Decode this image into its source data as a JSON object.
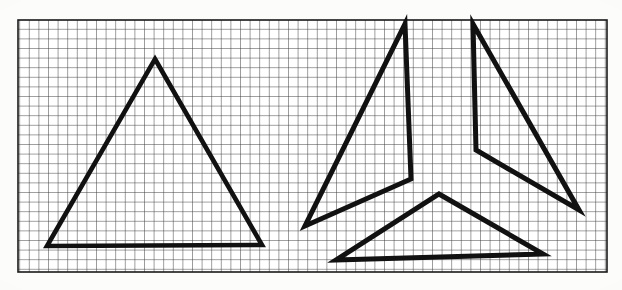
{
  "figure": {
    "kind": "line-drawing",
    "background_color": "#fcfcfb",
    "ink_color": "#111111",
    "grid_color": "#3b3b3b"
  },
  "canvas": {
    "width": 622,
    "height": 290
  },
  "grid": {
    "label": "graph-paper grid",
    "x": 18,
    "y": 20,
    "width": 589,
    "height": 252,
    "cell_size": 9.6,
    "line_color": "#3d3d3d",
    "line_width": 1.0,
    "border_color": "#1a1a1a",
    "border_width": 1.6,
    "columns": 61,
    "rows": 26
  },
  "shapes": [
    {
      "name": "intact-triangle",
      "role": "complete triangle on the left",
      "stroke_width": 4.6,
      "closed": true,
      "points": [
        [
          155,
          59
        ],
        [
          262,
          245
        ],
        [
          47,
          246
        ]
      ]
    },
    {
      "name": "fragment-left-chevron",
      "role": "left arm of the fragmented triangle",
      "stroke_width": 5.0,
      "closed": true,
      "points": [
        [
          405,
          24
        ],
        [
          411,
          179
        ],
        [
          305,
          226
        ]
      ]
    },
    {
      "name": "fragment-right-chevron",
      "role": "right arm of the fragmented triangle",
      "stroke_width": 5.0,
      "closed": true,
      "points": [
        [
          473,
          24
        ],
        [
          579,
          210
        ],
        [
          476,
          150
        ]
      ]
    },
    {
      "name": "fragment-bottom-chevron",
      "role": "base arm of the fragmented triangle",
      "stroke_width": 5.0,
      "closed": true,
      "points": [
        [
          439,
          194
        ],
        [
          543,
          254
        ],
        [
          336,
          260
        ]
      ]
    }
  ],
  "chart_data": {
    "type": "scatter",
    "xlabel": "",
    "ylabel": "",
    "xlim": [
      0,
      622
    ],
    "ylim": [
      290,
      0
    ],
    "grid": true,
    "legend": "none",
    "series": [
      {
        "name": "intact-triangle",
        "x": [
          155,
          262,
          47,
          155
        ],
        "y": [
          59,
          245,
          246,
          59
        ]
      },
      {
        "name": "fragment-left-chevron",
        "x": [
          405,
          411,
          305,
          405
        ],
        "y": [
          24,
          179,
          226,
          24
        ]
      },
      {
        "name": "fragment-right-chevron",
        "x": [
          473,
          579,
          476,
          473
        ],
        "y": [
          24,
          210,
          150,
          24
        ]
      },
      {
        "name": "fragment-bottom-chevron",
        "x": [
          439,
          543,
          336,
          439
        ],
        "y": [
          194,
          254,
          260,
          194
        ]
      }
    ]
  }
}
